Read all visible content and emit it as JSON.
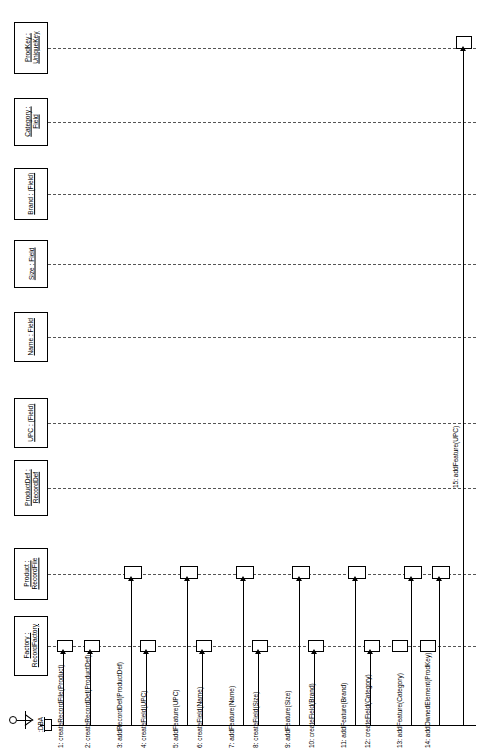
{
  "diagram": {
    "type": "uml-sequence-diagram",
    "orientation": "rotated-90-ccw",
    "actor": {
      "name": ":DBA"
    },
    "lifelines": [
      {
        "id": "prodkey",
        "label": "ProdKey :\nUniqueKey",
        "line1": "ProdKey :",
        "line2": "UniqueKey"
      },
      {
        "id": "category",
        "label": "Category :\nField",
        "line1": "Category :",
        "line2": "Field"
      },
      {
        "id": "brand",
        "label": "Brand : (Field)",
        "line1": "Brand : (Field)",
        "line2": ""
      },
      {
        "id": "size",
        "label": "Size : Field",
        "line1": "Size : Field",
        "line2": ""
      },
      {
        "id": "name",
        "label": "Name : Field",
        "line1": "Name : Field",
        "line2": ""
      },
      {
        "id": "upc",
        "label": "UPC : (Field)",
        "line1": "UPC : (Field)",
        "line2": ""
      },
      {
        "id": "productdef",
        "label": "ProductDef :\nRecordDef",
        "line1": "ProductDef :",
        "line2": "RecordDef"
      },
      {
        "id": "product",
        "label": "Product :\nRecordFile",
        "line1": "Product :",
        "line2": "RecordFile"
      },
      {
        "id": "factory",
        "label": "Factory :\nRecordFactory",
        "line1": "Factory :",
        "line2": "RecordFactory"
      }
    ],
    "messages": [
      {
        "n": 1,
        "label": "1: createRecordFile(Product)"
      },
      {
        "n": 2,
        "label": "2: createRecordDef(ProductDef)"
      },
      {
        "n": 3,
        "label": "3: addRecordDef(ProductDef)"
      },
      {
        "n": 4,
        "label": "4: createField(UPC)"
      },
      {
        "n": 5,
        "label": "5: addFeature(UPC)"
      },
      {
        "n": 6,
        "label": "6: createField(Name)"
      },
      {
        "n": 7,
        "label": "7: addFeature(Name)"
      },
      {
        "n": 8,
        "label": "8: createField(Size)"
      },
      {
        "n": 9,
        "label": "9: addFeature(Size)"
      },
      {
        "n": 10,
        "label": "10: createField(Brand)"
      },
      {
        "n": 11,
        "label": "11: addFeature(Brand)"
      },
      {
        "n": 12,
        "label": "12: createField(Category)"
      },
      {
        "n": 13,
        "label": "13: addFeature(Category)"
      },
      {
        "n": 14,
        "label": "14: addOwnedElement(ProdKey)"
      },
      {
        "n": 15,
        "label": "15: addFeature(UPC)"
      }
    ],
    "colors": {
      "ink": "#000000",
      "dash": "#555555",
      "paper": "#ffffff"
    }
  }
}
